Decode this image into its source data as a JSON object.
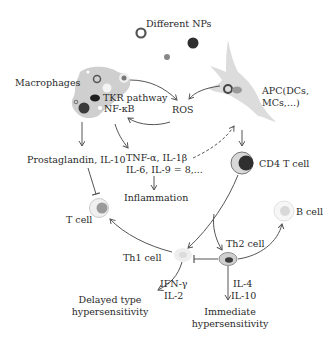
{
  "labels": {
    "nps": "Different NPs",
    "macrophages": "Macrophages",
    "tkr": "TKR pathway",
    "nfkb": "NF-κB",
    "ros": "ROS",
    "apc_line1": "APC(DCs,",
    "apc_line2": "MCs,...)",
    "prostaglandin": "Prostaglandin, IL-10",
    "cytokines_line1": "TNF-α, IL-1β",
    "cytokines_line2": "IL-6, IL-9 = 8,...",
    "inflammation": "Inflammation",
    "cd4": "CD4 T cell",
    "tcell": "T cell",
    "bcell": "B cell",
    "th1": "Th1 cell",
    "th2": "Th2 cell",
    "ifn_line1": "IFN-γ",
    "ifn_line2": "IL-2",
    "il4_line1": "IL-4",
    "il4_line2": "IL-10",
    "dth_line1": "Delayed type",
    "dth_line2": "hypersensitivity",
    "ih_line1": "Immediate",
    "ih_line2": "hypersensitivity"
  },
  "colors": {
    "cell_fill": "#d4d4d4",
    "cell_light": "#ececec",
    "nucleus_dark": "#3a3a3a",
    "arrow": "#555555",
    "text": "#2a2a2a"
  }
}
